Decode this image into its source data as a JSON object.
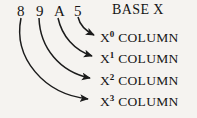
{
  "diagram": {
    "background_color": "#f5f3f0",
    "ink_color": "#1b1b1b",
    "number": {
      "label": "89A5",
      "digits": [
        {
          "char": "8",
          "place": 3,
          "x": 17,
          "y": 4
        },
        {
          "char": "9",
          "place": 2,
          "x": 36,
          "y": 4
        },
        {
          "char": "A",
          "place": 1,
          "x": 54,
          "y": 4
        },
        {
          "char": "5",
          "place": 0,
          "x": 74,
          "y": 4
        }
      ]
    },
    "base_label": "BASE X",
    "columns": [
      {
        "base_symbol": "X",
        "exponent": "0",
        "word": "COLUMN",
        "y": 31
      },
      {
        "base_symbol": "X",
        "exponent": "1",
        "word": "COLUMN",
        "y": 52
      },
      {
        "base_symbol": "X",
        "exponent": "2",
        "word": "COLUMN",
        "y": 74
      },
      {
        "base_symbol": "X",
        "exponent": "3",
        "word": "COLUMN",
        "y": 95
      }
    ],
    "arrows": [
      {
        "from_digit": "5",
        "to_column": "X0",
        "path": "M 78 17 C 80 26, 86 31, 94 35"
      },
      {
        "from_digit": "A",
        "to_column": "X1",
        "path": "M 58 18 C 62 36, 74 50, 92 56"
      },
      {
        "from_digit": "9",
        "to_column": "X2",
        "path": "M 39 18 C 40 48, 60 72, 90 78"
      },
      {
        "from_digit": "8",
        "to_column": "X3",
        "path": "M 21 18 C 13 58, 44 94, 88 99"
      }
    ]
  }
}
